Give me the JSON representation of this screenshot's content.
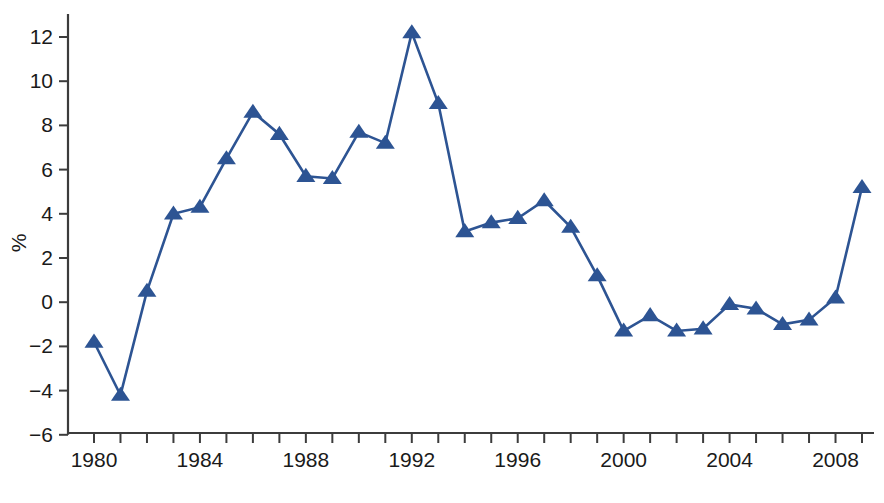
{
  "chart_data": {
    "type": "line",
    "title": "",
    "subtitle": "",
    "xlabel": "",
    "ylabel": "%",
    "xlim": [
      1979.4,
      2009.6
    ],
    "ylim": [
      -6,
      12.8
    ],
    "ytick_step": 2,
    "xtick_step": 1,
    "xlabel_step": 4,
    "grid": false,
    "legend": "none",
    "marker": "triangle-up",
    "series_color": "#2d5493",
    "axis_color": "#3c3c3c",
    "background_color": "#ffffff",
    "y_ticks": [
      -6,
      -4,
      -2,
      0,
      2,
      4,
      6,
      8,
      10,
      12
    ],
    "y_tick_labels": [
      "−6",
      "−4",
      "−2",
      "0",
      "2",
      "4",
      "6",
      "8",
      "10",
      "12"
    ],
    "x_ticks": [
      1980,
      1981,
      1982,
      1983,
      1984,
      1985,
      1986,
      1987,
      1988,
      1989,
      1990,
      1991,
      1992,
      1993,
      1994,
      1995,
      1996,
      1997,
      1998,
      1999,
      2000,
      2001,
      2002,
      2003,
      2004,
      2005,
      2006,
      2007,
      2008,
      2009
    ],
    "x_tick_labels": [
      "1980",
      "1984",
      "1988",
      "1992",
      "1996",
      "2000",
      "2004",
      "2008"
    ],
    "x_labeled_ticks": [
      1980,
      1984,
      1988,
      1992,
      1996,
      2000,
      2004,
      2008
    ],
    "x": [
      1980,
      1981,
      1982,
      1983,
      1984,
      1985,
      1986,
      1987,
      1988,
      1989,
      1990,
      1991,
      1992,
      1993,
      1994,
      1995,
      1996,
      1997,
      1998,
      1999,
      2000,
      2001,
      2002,
      2003,
      2004,
      2005,
      2006,
      2007,
      2008,
      2009
    ],
    "values": [
      -1.8,
      -4.2,
      0.5,
      4.0,
      4.3,
      6.5,
      8.6,
      7.6,
      5.7,
      5.6,
      7.7,
      7.2,
      12.2,
      9.0,
      3.2,
      3.6,
      3.8,
      4.6,
      3.4,
      1.2,
      -1.3,
      -0.6,
      -1.3,
      -1.2,
      -0.1,
      -0.3,
      -1.0,
      -0.8,
      0.2,
      5.2
    ],
    "series": [
      {
        "name": "",
        "values": [
          -1.8,
          -4.2,
          0.5,
          4.0,
          4.3,
          6.5,
          8.6,
          7.6,
          5.7,
          5.6,
          7.7,
          7.2,
          12.2,
          9.0,
          3.2,
          3.6,
          3.8,
          4.6,
          3.4,
          1.2,
          -1.3,
          -0.6,
          -1.3,
          -1.2,
          -0.1,
          -0.3,
          -1.0,
          -0.8,
          0.2,
          5.2
        ]
      }
    ]
  }
}
